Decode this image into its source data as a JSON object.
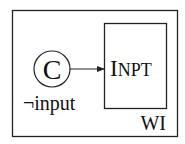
{
  "diagram": {
    "outer_box": {
      "label": "WI"
    },
    "state": {
      "label": "C",
      "guard": "¬input"
    },
    "target_box": {
      "label_first": "I",
      "label_rest": "NPT"
    },
    "colors": {
      "stroke": "#222222",
      "background": "#ffffff"
    }
  }
}
